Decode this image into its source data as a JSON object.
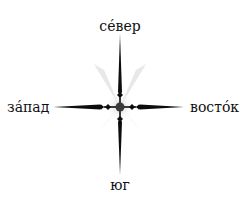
{
  "diagram": {
    "type": "compass-rose",
    "labels": {
      "north": "сéвер",
      "south": "юг",
      "west": "зáпад",
      "east": "востóк"
    },
    "colors": {
      "needle": "#0d0d0d",
      "hub": "#3a3a3a",
      "glow": "#d9d9d9",
      "text": "#111111"
    }
  }
}
